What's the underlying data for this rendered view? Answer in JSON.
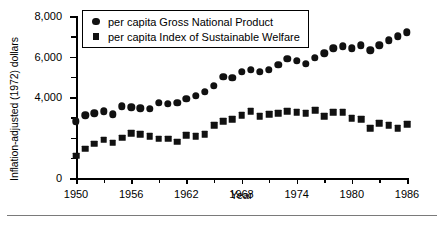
{
  "chart_data": {
    "type": "scatter",
    "title": "",
    "xlabel": "Year",
    "ylabel": "Inflation-adjusted (1972) dollars",
    "xlim": [
      1950,
      1986
    ],
    "ylim": [
      0,
      8000
    ],
    "grid": false,
    "legend_position": "top-left-inside",
    "y_tick_labels": [
      "0",
      "4,000",
      "6,000",
      "8,000"
    ],
    "y_major_ticks": [
      0,
      4000,
      6000,
      8000
    ],
    "y_minor_ticks": [
      1000,
      2000,
      3000,
      5000,
      7000
    ],
    "x_tick_labels": [
      "1950",
      "1956",
      "1962",
      "1968",
      "1974",
      "1980",
      "1986"
    ],
    "x_major_ticks": [
      1950,
      1956,
      1962,
      1968,
      1974,
      1980,
      1986
    ],
    "x_minor_ticks": [
      1953,
      1959,
      1965,
      1971,
      1977,
      1983
    ],
    "x": [
      1950,
      1951,
      1952,
      1953,
      1954,
      1955,
      1956,
      1957,
      1958,
      1959,
      1960,
      1961,
      1962,
      1963,
      1964,
      1965,
      1966,
      1967,
      1968,
      1969,
      1970,
      1971,
      1972,
      1973,
      1974,
      1975,
      1976,
      1977,
      1978,
      1979,
      1980,
      1981,
      1982,
      1983,
      1984,
      1985,
      1986
    ],
    "series": [
      {
        "name": "per capita Gross National Product",
        "marker": "circle",
        "color": "#111111",
        "values": [
          2800,
          3100,
          3200,
          3300,
          3150,
          3550,
          3500,
          3450,
          3430,
          3700,
          3660,
          3700,
          3900,
          4050,
          4250,
          4550,
          5000,
          4950,
          5250,
          5350,
          5250,
          5350,
          5600,
          5900,
          5800,
          5650,
          5950,
          6150,
          6400,
          6500,
          6400,
          6550,
          6300,
          6550,
          6800,
          7000,
          7200
        ]
      },
      {
        "name": "per capita Index of Sustainable Welfare",
        "marker": "square",
        "color": "#111111",
        "values": [
          1100,
          1450,
          1700,
          1900,
          1750,
          2000,
          2200,
          2150,
          2050,
          1950,
          1950,
          1800,
          2100,
          2050,
          2150,
          2600,
          2800,
          2900,
          3100,
          3300,
          3050,
          3150,
          3200,
          3300,
          3250,
          3200,
          3350,
          3050,
          3250,
          3250,
          2950,
          2900,
          2450,
          2700,
          2600,
          2450,
          2650
        ]
      }
    ]
  },
  "legend": {
    "items": [
      {
        "marker": "circle",
        "label": "per capita Gross National Product"
      },
      {
        "marker": "square",
        "label": "per capita Index of Sustainable Welfare"
      }
    ]
  }
}
